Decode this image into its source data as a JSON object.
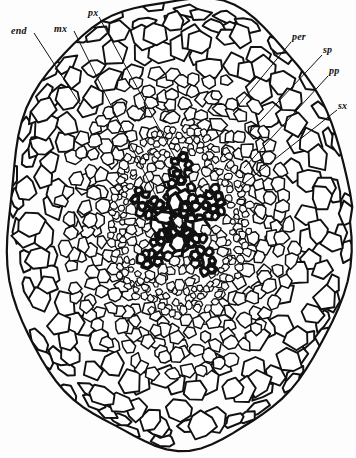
{
  "figure": {
    "width": 356,
    "height": 458,
    "background_color": "#fdfdfd",
    "ink_color": "#111111"
  },
  "labels": [
    {
      "id": "end",
      "text": "end",
      "meaning": "endodermis",
      "text_x": 11,
      "text_y": 26,
      "leader": {
        "x1": 34,
        "y1": 33,
        "x2": 80,
        "y2": 104
      }
    },
    {
      "id": "mx",
      "text": "mx",
      "meaning": "metaxylem",
      "text_x": 54,
      "text_y": 24,
      "leader": {
        "x1": 74,
        "y1": 31,
        "x2": 156,
        "y2": 196
      }
    },
    {
      "id": "px",
      "text": "px",
      "meaning": "protoxylem",
      "text_x": 88,
      "text_y": 8,
      "leader": {
        "x1": 99,
        "y1": 17,
        "x2": 186,
        "y2": 178
      }
    },
    {
      "id": "per",
      "text": "per",
      "meaning": "pericycle",
      "text_x": 292,
      "text_y": 32,
      "leader": {
        "x1": 291,
        "y1": 42,
        "x2": 233,
        "y2": 112
      }
    },
    {
      "id": "sp",
      "text": "sp",
      "meaning": "sieve plate / phloem",
      "text_x": 323,
      "text_y": 45,
      "leader": {
        "x1": 322,
        "y1": 55,
        "x2": 248,
        "y2": 134
      }
    },
    {
      "id": "pp",
      "text": "pp",
      "meaning": "protophloem",
      "text_x": 329,
      "text_y": 66,
      "leader": {
        "x1": 328,
        "y1": 76,
        "x2": 244,
        "y2": 168
      }
    },
    {
      "id": "sx",
      "text": "sx",
      "meaning": "secondary xylem",
      "text_x": 338,
      "text_y": 101,
      "leader": {
        "x1": 337,
        "y1": 110,
        "x2": 241,
        "y2": 186
      }
    }
  ],
  "anatomy": {
    "center_x": 178,
    "center_y": 222,
    "outline_radius_x": 172,
    "outline_radius_y": 224,
    "zones": [
      {
        "name": "epidermis",
        "inner": 0.93,
        "outer": 1.0,
        "cell_scale": 15,
        "wall": 2.0,
        "fill": "#ffffff"
      },
      {
        "name": "outer-cortex",
        "inner": 0.68,
        "outer": 0.93,
        "cell_scale": 20,
        "wall": 1.9,
        "fill": "#ffffff"
      },
      {
        "name": "inner-cortex",
        "inner": 0.42,
        "outer": 0.68,
        "cell_scale": 12,
        "wall": 1.5,
        "fill": "#ffffff"
      },
      {
        "name": "endodermis",
        "inner": 0.35,
        "outer": 0.42,
        "cell_scale": 7,
        "wall": 1.2,
        "fill": "#ffffff"
      },
      {
        "name": "pericycle",
        "inner": 0.3,
        "outer": 0.35,
        "cell_scale": 6,
        "wall": 1.2,
        "fill": "#ffffff"
      },
      {
        "name": "stele",
        "inner": 0.0,
        "outer": 0.3,
        "cell_scale": 9,
        "wall": 1.6,
        "fill": "#fafafa"
      }
    ],
    "xylem_arms": [
      {
        "name": "arm-north",
        "angle_deg": -86,
        "length": 0.3,
        "width": 0.085
      },
      {
        "name": "arm-northeast",
        "angle_deg": -22,
        "length": 0.29,
        "width": 0.08
      },
      {
        "name": "arm-southeast",
        "angle_deg": 48,
        "length": 0.3,
        "width": 0.08
      },
      {
        "name": "arm-southwest",
        "angle_deg": 132,
        "length": 0.27,
        "width": 0.075
      },
      {
        "name": "arm-northwest",
        "angle_deg": 205,
        "length": 0.29,
        "width": 0.08
      }
    ],
    "metaxylem_vessels": [
      {
        "cx": 0.0,
        "cy": -0.1,
        "r": 0.055
      },
      {
        "cx": 0.1,
        "cy": 0.02,
        "r": 0.05
      },
      {
        "cx": -0.02,
        "cy": 0.1,
        "r": 0.048
      },
      {
        "cx": -0.11,
        "cy": -0.01,
        "r": 0.045
      }
    ]
  },
  "legend": {
    "end": "endodermis",
    "mx": "metaxylem",
    "px": "protoxylem",
    "per": "pericycle",
    "sp": "sieve plate",
    "pp": "protophloem",
    "sx": "secondary xylem"
  }
}
